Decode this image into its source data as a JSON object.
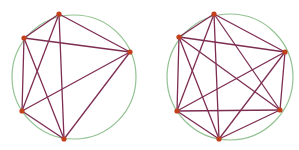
{
  "colors": {
    "background": "#ffffff",
    "circle": "#93c293",
    "edge": "#7d2d52",
    "vertex": "#c2401c"
  },
  "graphs": [
    {
      "name": "complete-graph-k5",
      "circle": {
        "cx": 74,
        "cy": 77,
        "r": 62
      },
      "vertices": [
        {
          "id": "top",
          "x": 59,
          "y": 14
        },
        {
          "id": "upper-left",
          "x": 24,
          "y": 38
        },
        {
          "id": "right",
          "x": 130,
          "y": 52
        },
        {
          "id": "lower-left",
          "x": 22,
          "y": 111
        },
        {
          "id": "bottom",
          "x": 64,
          "y": 139
        }
      ],
      "edges": [
        [
          "top",
          "upper-left"
        ],
        [
          "top",
          "right"
        ],
        [
          "top",
          "lower-left"
        ],
        [
          "top",
          "bottom"
        ],
        [
          "upper-left",
          "right"
        ],
        [
          "upper-left",
          "lower-left"
        ],
        [
          "upper-left",
          "bottom"
        ],
        [
          "right",
          "lower-left"
        ],
        [
          "right",
          "bottom"
        ],
        [
          "lower-left",
          "bottom"
        ]
      ]
    },
    {
      "name": "complete-graph-k6",
      "circle": {
        "cx": 230,
        "cy": 77,
        "r": 63
      },
      "vertices": [
        {
          "id": "top",
          "x": 214,
          "y": 14
        },
        {
          "id": "upper-left",
          "x": 179,
          "y": 37
        },
        {
          "id": "right",
          "x": 285,
          "y": 52
        },
        {
          "id": "lower-left",
          "x": 177,
          "y": 111
        },
        {
          "id": "bottom",
          "x": 219,
          "y": 139
        },
        {
          "id": "lower-right",
          "x": 280,
          "y": 110
        }
      ],
      "edges": [
        [
          "top",
          "upper-left"
        ],
        [
          "top",
          "right"
        ],
        [
          "top",
          "lower-left"
        ],
        [
          "top",
          "bottom"
        ],
        [
          "top",
          "lower-right"
        ],
        [
          "upper-left",
          "right"
        ],
        [
          "upper-left",
          "lower-left"
        ],
        [
          "upper-left",
          "bottom"
        ],
        [
          "upper-left",
          "lower-right"
        ],
        [
          "right",
          "lower-left"
        ],
        [
          "right",
          "bottom"
        ],
        [
          "right",
          "lower-right"
        ],
        [
          "lower-left",
          "bottom"
        ],
        [
          "lower-left",
          "lower-right"
        ],
        [
          "bottom",
          "lower-right"
        ]
      ]
    }
  ]
}
